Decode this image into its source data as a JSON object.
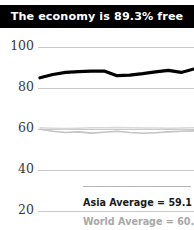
{
  "title": {
    "text": "The economy is 89.3% free"
  },
  "legend": {
    "asia": "Asia Average = 59.1",
    "world": "World Average = 60.6"
  },
  "chart_data": {
    "type": "line",
    "title": "The economy is 89.3% free",
    "xlabel": "",
    "ylabel": "",
    "ylim": [
      14,
      104
    ],
    "yticks": [
      100,
      80,
      60,
      40,
      20
    ],
    "ytick_labels": [
      "100",
      "80",
      "60",
      "40",
      "20"
    ],
    "grid": true,
    "legend_position": "bottom-right",
    "x": [
      0,
      1,
      2,
      3,
      4,
      5,
      6,
      7,
      8,
      9,
      10,
      11,
      12
    ],
    "series": [
      {
        "name": "Country",
        "color": "#000000",
        "values": [
          85.0,
          86.6,
          87.6,
          88.0,
          88.2,
          88.3,
          86.0,
          86.3,
          87.0,
          87.9,
          88.6,
          87.6,
          89.3
        ]
      },
      {
        "name": "World Average",
        "color": "#d8d8d8",
        "values": [
          60.6,
          60.4,
          60.2,
          60.4,
          60.6,
          60.6,
          60.7,
          60.6,
          60.5,
          60.5,
          60.4,
          60.5,
          60.6
        ]
      },
      {
        "name": "Asia Average",
        "color": "#c4c4c4",
        "values": [
          59.9,
          58.9,
          58.3,
          58.6,
          58.0,
          58.4,
          58.9,
          58.3,
          57.9,
          58.2,
          58.6,
          58.9,
          59.1
        ]
      }
    ],
    "annotations": [
      {
        "label": "Asia Average = 59.1",
        "value": 59.1
      },
      {
        "label": "World Average = 60.6",
        "value": 60.6
      }
    ]
  }
}
